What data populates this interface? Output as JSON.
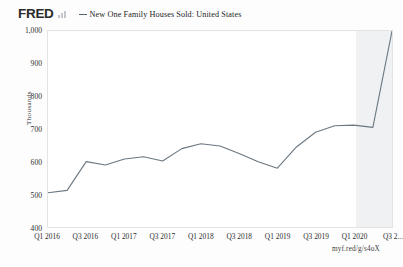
{
  "branding": {
    "logo_text": "FRED",
    "logo_icon": "bar-chart-icon"
  },
  "legend": {
    "series_label": "New One Family Houses Sold: United States"
  },
  "footer": {
    "source_link": "myf.red/g/s4oX"
  },
  "chart_data": {
    "type": "line",
    "title": "New One Family Houses Sold: United States",
    "xlabel": "",
    "ylabel": "Thousands",
    "ylim": [
      400,
      1000
    ],
    "ytick_labels": [
      "1,000",
      "900",
      "800",
      "700",
      "600",
      "500",
      "400"
    ],
    "ytick_values": [
      1000,
      900,
      800,
      700,
      600,
      500,
      400
    ],
    "xtick_labels": [
      "Q1 2016",
      "Q3 2016",
      "Q1 2017",
      "Q3 2017",
      "Q1 2018",
      "Q3 2018",
      "Q1 2019",
      "Q3 2019",
      "Q1 2020",
      "Q3 2..."
    ],
    "grid": false,
    "legend_position": "top",
    "line_color": "#6b7780",
    "recession_band_color": "#eceef0",
    "recession_band": {
      "start": "Q1 2020",
      "end": "Q3 2020"
    },
    "x": [
      "Q1 2016",
      "Q2 2016",
      "Q3 2016",
      "Q4 2016",
      "Q1 2017",
      "Q2 2017",
      "Q3 2017",
      "Q4 2017",
      "Q1 2018",
      "Q2 2018",
      "Q3 2018",
      "Q4 2018",
      "Q1 2019",
      "Q2 2019",
      "Q3 2019",
      "Q4 2019",
      "Q1 2020",
      "Q2 2020",
      "Q3 2020"
    ],
    "values": [
      505,
      512,
      600,
      590,
      608,
      615,
      602,
      640,
      655,
      648,
      625,
      600,
      580,
      645,
      690,
      710,
      712,
      705,
      1000
    ]
  }
}
